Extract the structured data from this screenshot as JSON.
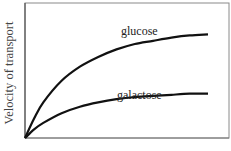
{
  "chart_data": {
    "type": "line",
    "title": "",
    "xlabel": "",
    "ylabel": "Velocity of transport",
    "x": [
      0,
      0.05,
      0.1,
      0.2,
      0.3,
      0.4,
      0.5,
      0.6,
      0.7,
      0.8,
      0.9,
      1.0
    ],
    "series": [
      {
        "name": "glucose",
        "values": [
          0,
          0.18,
          0.33,
          0.53,
          0.66,
          0.75,
          0.82,
          0.87,
          0.9,
          0.93,
          0.95,
          0.96
        ]
      },
      {
        "name": "galactose",
        "values": [
          0,
          0.08,
          0.14,
          0.23,
          0.29,
          0.33,
          0.36,
          0.38,
          0.39,
          0.4,
          0.41,
          0.41
        ]
      }
    ],
    "grid": false,
    "legend": "inline labels above curves",
    "ylim": [
      0,
      1
    ],
    "xlim": [
      0,
      1.1
    ]
  },
  "labels": {
    "ylabel": "Velocity of transport",
    "glucose": "glucose",
    "galactose": "galactose"
  }
}
